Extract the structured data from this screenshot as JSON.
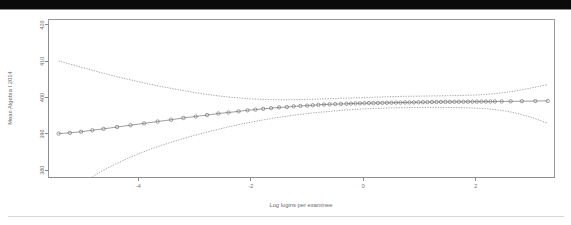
{
  "figure": {
    "background_color": "#ffffff",
    "top_band_color": "#0b0b0b"
  },
  "chart_data": {
    "type": "scatter",
    "title": "",
    "subtitle": "",
    "xlabel": "Log logins per examinee",
    "ylabel": "Mean Algebra I 2014",
    "xlim": [
      -5.6,
      3.4
    ],
    "ylim": [
      378.0,
      421.5
    ],
    "xticks": [
      -4,
      -2,
      0,
      2
    ],
    "xticklabels": [
      "-4",
      "-2",
      "0",
      "2"
    ],
    "yticks": [
      380,
      390,
      400,
      410,
      420
    ],
    "yticklabels": [
      "380",
      "390",
      "400",
      "410",
      "420"
    ],
    "grid": false,
    "legend_position": "none",
    "marker_style": "open-circle",
    "series": [
      {
        "name": "Fitted mean",
        "style": "line-with-open-circles",
        "x": [
          -5.42,
          -5.22,
          -5.02,
          -4.82,
          -4.62,
          -4.38,
          -4.14,
          -3.9,
          -3.66,
          -3.42,
          -3.2,
          -2.98,
          -2.78,
          -2.58,
          -2.4,
          -2.22,
          -2.06,
          -1.92,
          -1.78,
          -1.64,
          -1.5,
          -1.36,
          -1.24,
          -1.12,
          -1.0,
          -0.9,
          -0.8,
          -0.7,
          -0.6,
          -0.5,
          -0.4,
          -0.3,
          -0.22,
          -0.14,
          -0.06,
          0.02,
          0.1,
          0.18,
          0.26,
          0.34,
          0.42,
          0.5,
          0.58,
          0.66,
          0.74,
          0.82,
          0.9,
          0.98,
          1.06,
          1.14,
          1.22,
          1.3,
          1.38,
          1.46,
          1.54,
          1.62,
          1.7,
          1.78,
          1.86,
          1.94,
          2.02,
          2.1,
          2.18,
          2.26,
          2.34,
          2.46,
          2.62,
          2.82,
          3.06,
          3.28
        ],
        "y": [
          390.1,
          390.3,
          390.6,
          391.0,
          391.4,
          391.9,
          392.4,
          392.9,
          393.4,
          393.9,
          394.4,
          394.8,
          395.2,
          395.6,
          395.9,
          396.2,
          396.5,
          396.7,
          396.9,
          397.1,
          397.3,
          397.4,
          397.6,
          397.7,
          397.8,
          397.9,
          398.0,
          398.1,
          398.15,
          398.2,
          398.25,
          398.3,
          398.35,
          398.4,
          398.42,
          398.45,
          398.48,
          398.5,
          398.52,
          398.55,
          398.57,
          398.6,
          398.62,
          398.64,
          398.66,
          398.68,
          398.7,
          398.72,
          398.74,
          398.76,
          398.78,
          398.8,
          398.81,
          398.82,
          398.83,
          398.84,
          398.85,
          398.86,
          398.87,
          398.88,
          398.89,
          398.9,
          398.91,
          398.92,
          398.93,
          398.95,
          398.97,
          399.0,
          399.05,
          399.1
        ]
      },
      {
        "name": "Upper confidence band",
        "style": "dotted",
        "x": [
          -5.42,
          -5.0,
          -4.6,
          -4.2,
          -3.8,
          -3.4,
          -3.0,
          -2.6,
          -2.2,
          -1.8,
          -1.4,
          -1.0,
          -0.6,
          -0.2,
          0.2,
          0.6,
          1.0,
          1.4,
          1.8,
          2.2,
          2.6,
          3.0,
          3.28
        ],
        "y": [
          410.1,
          408.3,
          406.6,
          405.1,
          403.7,
          402.5,
          401.4,
          400.5,
          399.9,
          399.5,
          399.4,
          399.5,
          399.7,
          399.9,
          400.1,
          400.3,
          400.4,
          400.5,
          400.6,
          400.9,
          401.6,
          402.7,
          403.6
        ]
      },
      {
        "name": "Lower confidence band",
        "style": "dotted",
        "x": [
          -4.82,
          -4.6,
          -4.2,
          -3.8,
          -3.4,
          -3.0,
          -2.6,
          -2.2,
          -1.8,
          -1.4,
          -1.0,
          -0.6,
          -0.2,
          0.2,
          0.6,
          1.0,
          1.4,
          1.8,
          2.2,
          2.6,
          3.0,
          3.28
        ],
        "y": [
          378.2,
          380.2,
          383.2,
          385.7,
          387.8,
          389.6,
          391.2,
          392.6,
          393.8,
          394.8,
          395.6,
          396.2,
          396.7,
          397.0,
          397.2,
          397.3,
          397.3,
          397.2,
          396.9,
          396.1,
          394.5,
          392.9
        ]
      }
    ]
  }
}
